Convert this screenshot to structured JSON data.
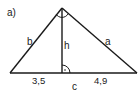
{
  "figure": {
    "part_label": "a)",
    "side_b": "b",
    "side_a": "a",
    "altitude": "h",
    "hypotenuse": "c",
    "segment_left": "3,5",
    "segment_right": "4,9",
    "line_color": "#1a1a1a"
  }
}
